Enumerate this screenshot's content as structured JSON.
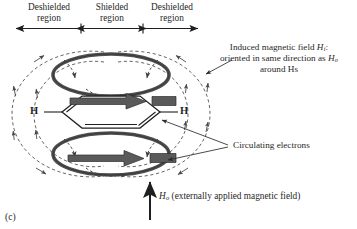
{
  "figure": {
    "panel_letter": "(c)",
    "regions": [
      {
        "name": "deshielded-left",
        "line1": "Deshielded",
        "line2": "region"
      },
      {
        "name": "shielded-center",
        "line1": "Shielded",
        "line2": "region"
      },
      {
        "name": "deshielded-right",
        "line1": "Deshielded",
        "line2": "region"
      }
    ],
    "atoms": [
      {
        "name": "hydrogen-left",
        "label": "H"
      },
      {
        "name": "hydrogen-right",
        "label": "H"
      }
    ],
    "annotations": {
      "induced_field": {
        "line1_pre": "Induced magnetic field ",
        "line1_sym": "H",
        "line1_sub": "i",
        "line1_post": ":",
        "line2_pre": "oriented in same direction as ",
        "line2_sym": "H",
        "line2_sub": "o",
        "line3": "around Hs"
      },
      "circulating_electrons": "Circulating electrons",
      "applied_field": {
        "symbol": "H",
        "subscript": "o",
        "text": " (externally applied magnetic field)"
      }
    },
    "colors": {
      "ink": "#1f1f1f",
      "ring_gray": "#5a5a5a",
      "arrow_gray": "#555555",
      "field_line": "#4a4a4a"
    }
  }
}
